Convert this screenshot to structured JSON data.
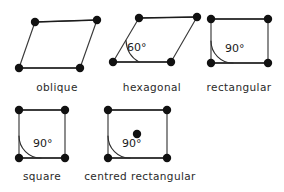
{
  "figure": {
    "background_color": "#ffffff",
    "line_color": "#3a3a3a",
    "point_color": "#111111",
    "text_color": "#2a2a2a"
  },
  "cells": [
    {
      "id": "oblique",
      "label": "oblique",
      "label_x": 57,
      "label_y": 91,
      "vertices": [
        [
          35,
          22
        ],
        [
          97,
          20
        ],
        [
          80,
          68
        ],
        [
          19,
          68
        ]
      ],
      "angle": null,
      "angle_label": "",
      "centered": false
    },
    {
      "id": "hexagonal",
      "label": "hexagonal",
      "label_x": 152,
      "label_y": 91,
      "vertices": [
        [
          139,
          18
        ],
        [
          197,
          17
        ],
        [
          171,
          62
        ],
        [
          113,
          62
        ]
      ],
      "angle": 60,
      "angle_label": "60°",
      "angle_vertex": [
        113,
        62
      ],
      "angle_radius": 26,
      "angle_text_x": 127,
      "angle_text_y": 51,
      "centered": false
    },
    {
      "id": "rectangular",
      "label": "rectangular",
      "label_x": 239,
      "label_y": 91,
      "vertices": [
        [
          211,
          19
        ],
        [
          268,
          19
        ],
        [
          268,
          63
        ],
        [
          211,
          63
        ]
      ],
      "angle": 90,
      "angle_label": "90°",
      "angle_vertex": [
        211,
        63
      ],
      "angle_radius": 22,
      "angle_text_x": 225,
      "angle_text_y": 52,
      "centered": false
    },
    {
      "id": "square",
      "label": "square",
      "label_x": 42,
      "label_y": 180,
      "vertices": [
        [
          19,
          110
        ],
        [
          65,
          110
        ],
        [
          65,
          158
        ],
        [
          19,
          158
        ]
      ],
      "angle": 90,
      "angle_label": "90°",
      "angle_vertex": [
        19,
        158
      ],
      "angle_radius": 22,
      "angle_text_x": 33,
      "angle_text_y": 147,
      "centered": false
    },
    {
      "id": "centred-rectangular",
      "label": "centred rectangular",
      "label_x": 140,
      "label_y": 180,
      "vertices": [
        [
          108,
          110
        ],
        [
          167,
          110
        ],
        [
          167,
          158
        ],
        [
          108,
          158
        ]
      ],
      "angle": 90,
      "angle_label": "90°",
      "angle_vertex": [
        108,
        158
      ],
      "angle_radius": 22,
      "angle_text_x": 122,
      "angle_text_y": 147,
      "centered": true,
      "center_point": [
        137,
        134
      ]
    }
  ],
  "point_radius": 4.2
}
